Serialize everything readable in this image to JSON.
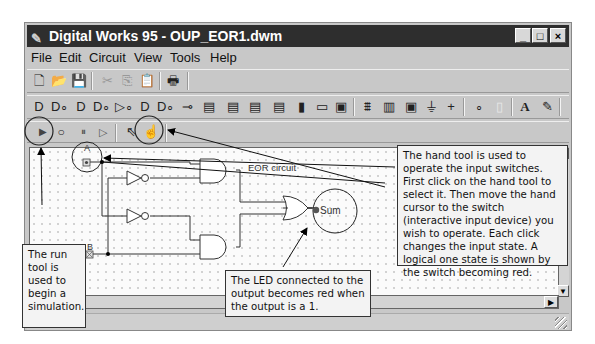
{
  "window": {
    "title": "Digital Works 95 - OUP_EOR1.dwm",
    "app_icon": "digital-works-icon",
    "controls": {
      "minimize": "_",
      "maximize": "□",
      "close": "×"
    }
  },
  "menubar": {
    "items": [
      {
        "label": "File",
        "accel": "F"
      },
      {
        "label": "Edit",
        "accel": "E"
      },
      {
        "label": "Circuit",
        "accel": "C"
      },
      {
        "label": "View",
        "accel": "V"
      },
      {
        "label": "Tools",
        "accel": "T"
      },
      {
        "label": "Help",
        "accel": "H"
      }
    ]
  },
  "toolbar_file": {
    "items": [
      {
        "name": "new-icon",
        "glyph": "🗋",
        "enabled": true
      },
      {
        "name": "open-icon",
        "glyph": "📂",
        "enabled": true
      },
      {
        "name": "save-icon",
        "glyph": "💾",
        "enabled": true
      },
      {
        "name": "cut-icon",
        "glyph": "✂",
        "enabled": false
      },
      {
        "name": "copy-icon",
        "glyph": "⎘",
        "enabled": false
      },
      {
        "name": "paste-icon",
        "glyph": "📋",
        "enabled": false
      },
      {
        "name": "print-icon",
        "glyph": "🖶",
        "enabled": true
      }
    ]
  },
  "toolbar_components": {
    "items": [
      {
        "name": "and-gate-icon",
        "glyph": "D"
      },
      {
        "name": "nand-gate-icon",
        "glyph": "D∘"
      },
      {
        "name": "or-gate-icon",
        "glyph": "D"
      },
      {
        "name": "nor-gate-icon",
        "glyph": "D∘"
      },
      {
        "name": "buffer-icon",
        "glyph": "▷∘"
      },
      {
        "name": "xor-gate-icon",
        "glyph": "D"
      },
      {
        "name": "xnor-gate-icon",
        "glyph": "D∘"
      },
      {
        "name": "inverter-icon",
        "glyph": "⊸"
      },
      {
        "name": "flipflop-sr-icon",
        "glyph": "▤"
      },
      {
        "name": "flipflop-d-icon",
        "glyph": "▤"
      },
      {
        "name": "flipflop-jk-icon",
        "glyph": "▤"
      },
      {
        "name": "register-icon",
        "glyph": "▤"
      },
      {
        "name": "switch-icon",
        "glyph": "▮"
      },
      {
        "name": "led-icon",
        "glyph": "▭"
      },
      {
        "name": "push-button-icon",
        "glyph": "▣"
      },
      {
        "name": "clock-icon",
        "glyph": "⩩"
      },
      {
        "name": "seven-segment-icon",
        "glyph": "▥"
      },
      {
        "name": "macro-icon",
        "glyph": "▣"
      },
      {
        "name": "ground-icon",
        "glyph": "⏚"
      },
      {
        "name": "power-icon",
        "glyph": "+"
      },
      {
        "name": "junction-icon",
        "glyph": "∘"
      },
      {
        "name": "wire-icon",
        "glyph": "▯"
      },
      {
        "name": "text-icon",
        "glyph": "A"
      },
      {
        "name": "pen-icon",
        "glyph": "✎"
      }
    ]
  },
  "toolbar_simulation": {
    "items": [
      {
        "name": "run-icon",
        "glyph": "▶"
      },
      {
        "name": "stop-icon",
        "glyph": "○"
      },
      {
        "name": "pause-icon",
        "glyph": "⏸"
      },
      {
        "name": "step-icon",
        "glyph": "▷"
      },
      {
        "name": "select-pointer-icon",
        "glyph": "⇖"
      },
      {
        "name": "hand-tool-icon",
        "glyph": "☝"
      }
    ]
  },
  "canvas": {
    "title": "EOR circuit",
    "inputs": [
      {
        "label": "A"
      },
      {
        "label": "B"
      }
    ],
    "output": {
      "label": "Sum"
    }
  },
  "annotations": {
    "run_tool": "The run tool is used to begin a simulation.",
    "hand_tool": "The hand tool is used to operate the input switches. First click on the hand tool to select it. Then move the hand cursor to the switch (interactive input device) you wish to operate. Each click changes the input state. A logical one state is shown by the switch becoming red.",
    "led": "The LED connected to the output becomes red when the output is a 1."
  },
  "colors": {
    "titlebar": "#2e2e2e",
    "window_bg": "#c8c8c8",
    "canvas_bg": "#fbfbfb",
    "callout_bg": "#f3f3f3",
    "led_off": "#555555"
  }
}
